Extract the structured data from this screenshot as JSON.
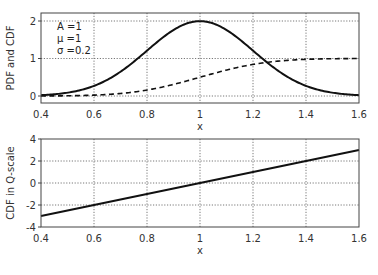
{
  "chart_data": [
    {
      "type": "line",
      "title": "",
      "xlabel": "x",
      "ylabel": "PDF and CDF",
      "xlim": [
        0.4,
        1.6
      ],
      "ylim": [
        -0.2,
        2.2
      ],
      "xticks": [
        0.4,
        0.6,
        0.8,
        1.0,
        1.2,
        1.4,
        1.6
      ],
      "xtick_labels": [
        "0.4",
        "0.6",
        "0.8",
        "1",
        "1.2",
        "1.4",
        "1.6"
      ],
      "yticks": [
        0,
        1,
        2
      ],
      "ytick_labels": [
        "0",
        "1",
        "2"
      ],
      "grid": true,
      "annotations": [
        "A =1",
        "μ =1",
        "σ =0.2"
      ],
      "series": [
        {
          "name": "PDF",
          "style": "solid",
          "x": [
            0.4,
            0.5,
            0.6,
            0.7,
            0.8,
            0.9,
            1.0,
            1.1,
            1.2,
            1.3,
            1.4,
            1.5,
            1.6
          ],
          "values": [
            0.022,
            0.088,
            0.27,
            0.648,
            1.21,
            1.76,
            1.995,
            1.76,
            1.21,
            0.648,
            0.27,
            0.088,
            0.022
          ]
        },
        {
          "name": "CDF",
          "style": "dashed",
          "x": [
            0.4,
            0.5,
            0.6,
            0.7,
            0.8,
            0.9,
            1.0,
            1.1,
            1.2,
            1.3,
            1.4,
            1.5,
            1.6
          ],
          "values": [
            0.001,
            0.006,
            0.023,
            0.067,
            0.159,
            0.309,
            0.5,
            0.691,
            0.841,
            0.933,
            0.977,
            0.994,
            0.999
          ]
        }
      ]
    },
    {
      "type": "line",
      "title": "",
      "xlabel": "x",
      "ylabel": "CDF in Q-scale",
      "xlim": [
        0.4,
        1.6
      ],
      "ylim": [
        -4,
        4
      ],
      "xticks": [
        0.4,
        0.6,
        0.8,
        1.0,
        1.2,
        1.4,
        1.6
      ],
      "xtick_labels": [
        "0.4",
        "0.6",
        "0.8",
        "1",
        "1.2",
        "1.4",
        "1.6"
      ],
      "yticks": [
        -4,
        -2,
        0,
        2,
        4
      ],
      "ytick_labels": [
        "-4",
        "-2",
        "0",
        "2",
        "4"
      ],
      "grid": true,
      "series": [
        {
          "name": "CDF (Q-scale)",
          "style": "solid",
          "x": [
            0.4,
            1.6
          ],
          "values": [
            -3,
            3
          ]
        }
      ]
    }
  ]
}
